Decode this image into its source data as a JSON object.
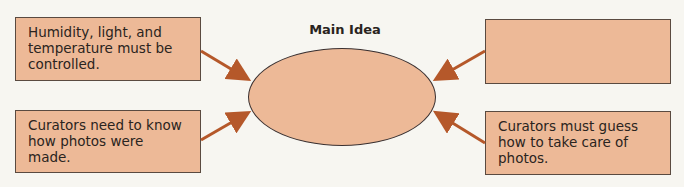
{
  "diagram": {
    "title": "Main Idea",
    "center": {
      "text": ""
    },
    "boxes": [
      {
        "position": "top-left",
        "text": "Humidity, light, and temperature must be controlled."
      },
      {
        "position": "bottom-left",
        "text": "Curators need to know how photos were made."
      },
      {
        "position": "top-right",
        "text": ""
      },
      {
        "position": "bottom-right",
        "text": "Curators must guess how to take care of photos."
      }
    ],
    "colors": {
      "fill": "#edb997",
      "arrow": "#b5582a",
      "border": "#5a4a40"
    }
  }
}
